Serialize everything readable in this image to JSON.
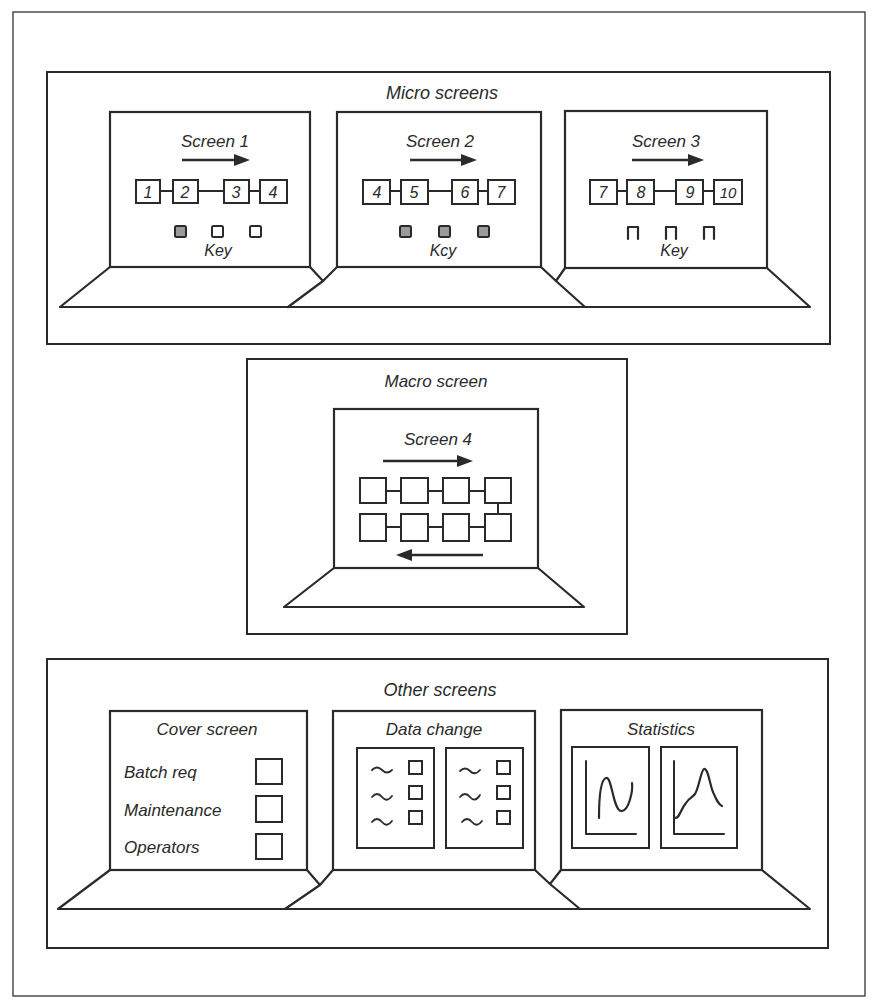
{
  "colors": {
    "ink": "#2a2a2a",
    "paper": "#ffffff"
  },
  "micro": {
    "title": "Micro screens",
    "screens": [
      {
        "title": "Screen 1",
        "nodes": [
          "1",
          "2",
          "3",
          "4"
        ],
        "key_label": "Key",
        "key_style": "shaded-first"
      },
      {
        "title": "Screen 2",
        "nodes": [
          "4",
          "5",
          "6",
          "7"
        ],
        "key_label": "Kcy",
        "key_style": "shaded-all"
      },
      {
        "title": "Screen 3",
        "nodes": [
          "7",
          "8",
          "9",
          "10"
        ],
        "key_label": "Key",
        "key_style": "open"
      }
    ]
  },
  "macro": {
    "title": "Macro screen",
    "screen": {
      "title": "Screen 4",
      "rows": 2,
      "cols": 4,
      "top_arrow": "right",
      "bottom_arrow": "left"
    }
  },
  "other": {
    "title": "Other screens",
    "cover": {
      "title": "Cover screen",
      "items": [
        {
          "label": "Batch req"
        },
        {
          "label": "Maintenance"
        },
        {
          "label": "Operators"
        }
      ]
    },
    "data_change": {
      "title": "Data change",
      "forms": 2,
      "fields_per_form": 3
    },
    "statistics": {
      "title": "Statistics",
      "charts": [
        "oscillating-curve",
        "peak-curve"
      ]
    }
  }
}
